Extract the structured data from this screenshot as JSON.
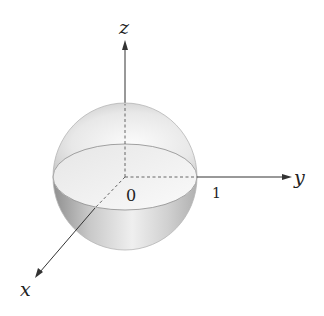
{
  "diagram": {
    "type": "3d-sphere-axes",
    "axes": {
      "x_label": "x",
      "y_label": "y",
      "z_label": "z"
    },
    "origin_label": "0",
    "tick_label": "1",
    "colors": {
      "axis": "#333333",
      "sphere_outline": "#9a9a9a",
      "sphere_light": "#f4f4f4",
      "sphere_dark": "#a8a8a8"
    }
  }
}
